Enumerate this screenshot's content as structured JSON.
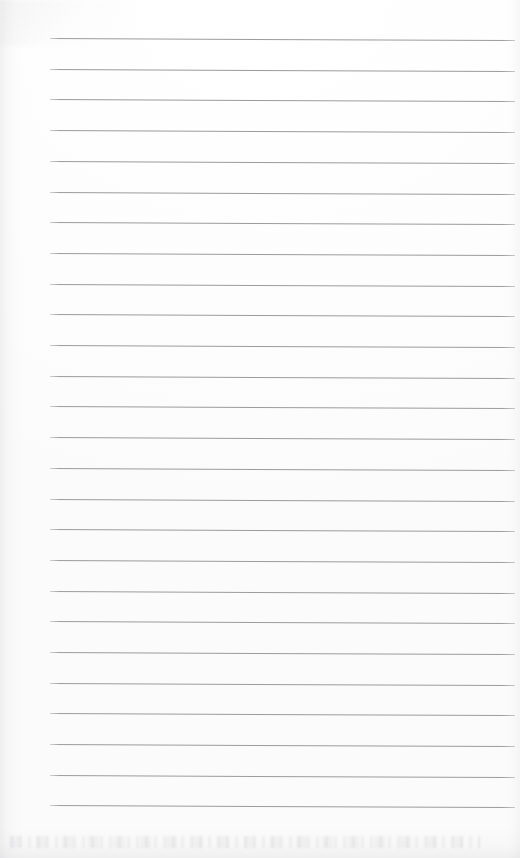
{
  "document": {
    "type": "scanned-page",
    "title": "Blank ruled notebook page",
    "content_text": "",
    "page_width": 520,
    "page_height": 858,
    "background_color": "#fefefe"
  },
  "ruling": {
    "line_count": 26,
    "line_color": "#9b9b9f",
    "line_thickness_px": 1,
    "line_spacing_px": 30.7,
    "first_line_y_px": 38,
    "left_margin_x_px": 50,
    "right_end_x_px": 515,
    "skew_degrees": 0.26,
    "lines": [
      {
        "index": 1,
        "y": 38.0,
        "x_start": 50,
        "x_end": 515
      },
      {
        "index": 2,
        "y": 68.7,
        "x_start": 50,
        "x_end": 515
      },
      {
        "index": 3,
        "y": 99.4,
        "x_start": 50,
        "x_end": 515
      },
      {
        "index": 4,
        "y": 130.1,
        "x_start": 50,
        "x_end": 515
      },
      {
        "index": 5,
        "y": 160.8,
        "x_start": 50,
        "x_end": 515
      },
      {
        "index": 6,
        "y": 191.5,
        "x_start": 50,
        "x_end": 515
      },
      {
        "index": 7,
        "y": 222.2,
        "x_start": 50,
        "x_end": 515
      },
      {
        "index": 8,
        "y": 252.9,
        "x_start": 50,
        "x_end": 515
      },
      {
        "index": 9,
        "y": 283.6,
        "x_start": 50,
        "x_end": 515
      },
      {
        "index": 10,
        "y": 314.3,
        "x_start": 50,
        "x_end": 515
      },
      {
        "index": 11,
        "y": 345.0,
        "x_start": 50,
        "x_end": 515
      },
      {
        "index": 12,
        "y": 375.7,
        "x_start": 50,
        "x_end": 515
      },
      {
        "index": 13,
        "y": 406.4,
        "x_start": 50,
        "x_end": 515
      },
      {
        "index": 14,
        "y": 437.1,
        "x_start": 50,
        "x_end": 515
      },
      {
        "index": 15,
        "y": 467.8,
        "x_start": 50,
        "x_end": 515
      },
      {
        "index": 16,
        "y": 498.5,
        "x_start": 50,
        "x_end": 515
      },
      {
        "index": 17,
        "y": 529.2,
        "x_start": 50,
        "x_end": 515
      },
      {
        "index": 18,
        "y": 559.9,
        "x_start": 50,
        "x_end": 515
      },
      {
        "index": 19,
        "y": 590.6,
        "x_start": 50,
        "x_end": 515
      },
      {
        "index": 20,
        "y": 621.3,
        "x_start": 50,
        "x_end": 515
      },
      {
        "index": 21,
        "y": 652.0,
        "x_start": 50,
        "x_end": 515
      },
      {
        "index": 22,
        "y": 682.7,
        "x_start": 50,
        "x_end": 515
      },
      {
        "index": 23,
        "y": 713.4,
        "x_start": 50,
        "x_end": 515
      },
      {
        "index": 24,
        "y": 744.1,
        "x_start": 50,
        "x_end": 515
      },
      {
        "index": 25,
        "y": 774.8,
        "x_start": 50,
        "x_end": 515
      },
      {
        "index": 26,
        "y": 804.5,
        "x_start": 50,
        "x_end": 515
      }
    ]
  },
  "scan_artifacts": {
    "left_edge_shadow": true,
    "right_edge_shadow": true,
    "bottom_edge_shadow": true,
    "top_left_smudge": true
  }
}
